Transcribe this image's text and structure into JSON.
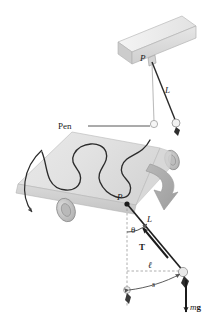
{
  "figure": {
    "background_color": "#ffffff",
    "width": 202,
    "height": 326
  },
  "palette": {
    "paper_light": "#ececec",
    "paper_mid": "#dcdcdc",
    "paper_dark": "#c9c9c9",
    "beam_light": "#f0f0f0",
    "beam_mid": "#dadada",
    "beam_dark": "#c2c2c2",
    "roller_light": "#d8d8d8",
    "roller_dark": "#b0b0b0",
    "trace_stroke": "#2b2b2b",
    "big_arrow": "#a9a9a9",
    "ink": "#1b1b1b",
    "string": "#222222",
    "bob_fill": "#f4f4f4",
    "dash": "#8c8c8c"
  },
  "upper_apparatus": {
    "support_beam": {
      "name": "support beam",
      "color": "#e4e4e4"
    },
    "pivot_label": "P",
    "string_label": "L",
    "rest_bob": {
      "name": "bob at rest"
    },
    "swung_bob": {
      "name": "bob displaced with pen tip"
    }
  },
  "recorder": {
    "pen_label": "Pen",
    "paper_roll": {
      "name": "moving paper roll"
    },
    "left_roller": {
      "name": "left roller"
    },
    "right_roller": {
      "name": "right roller"
    },
    "rotation_arrow": {
      "name": "roller rotation direction"
    },
    "trace": {
      "name": "sinusoidal pen trace",
      "cycles": 3
    }
  },
  "zoom_arrow": {
    "label": "",
    "color": "#a9a9a9"
  },
  "free_body": {
    "pivot_label": "P",
    "length_label": "L",
    "angle_label": "θ",
    "tension_label": "T",
    "horizontal_label": "ℓ",
    "arc_label": "s",
    "weight_label_m": "m",
    "weight_label_g": "g",
    "vertical_dashed": {
      "name": "vertical reference line"
    },
    "horizontal_dashed": {
      "name": "horizontal reference line"
    }
  }
}
